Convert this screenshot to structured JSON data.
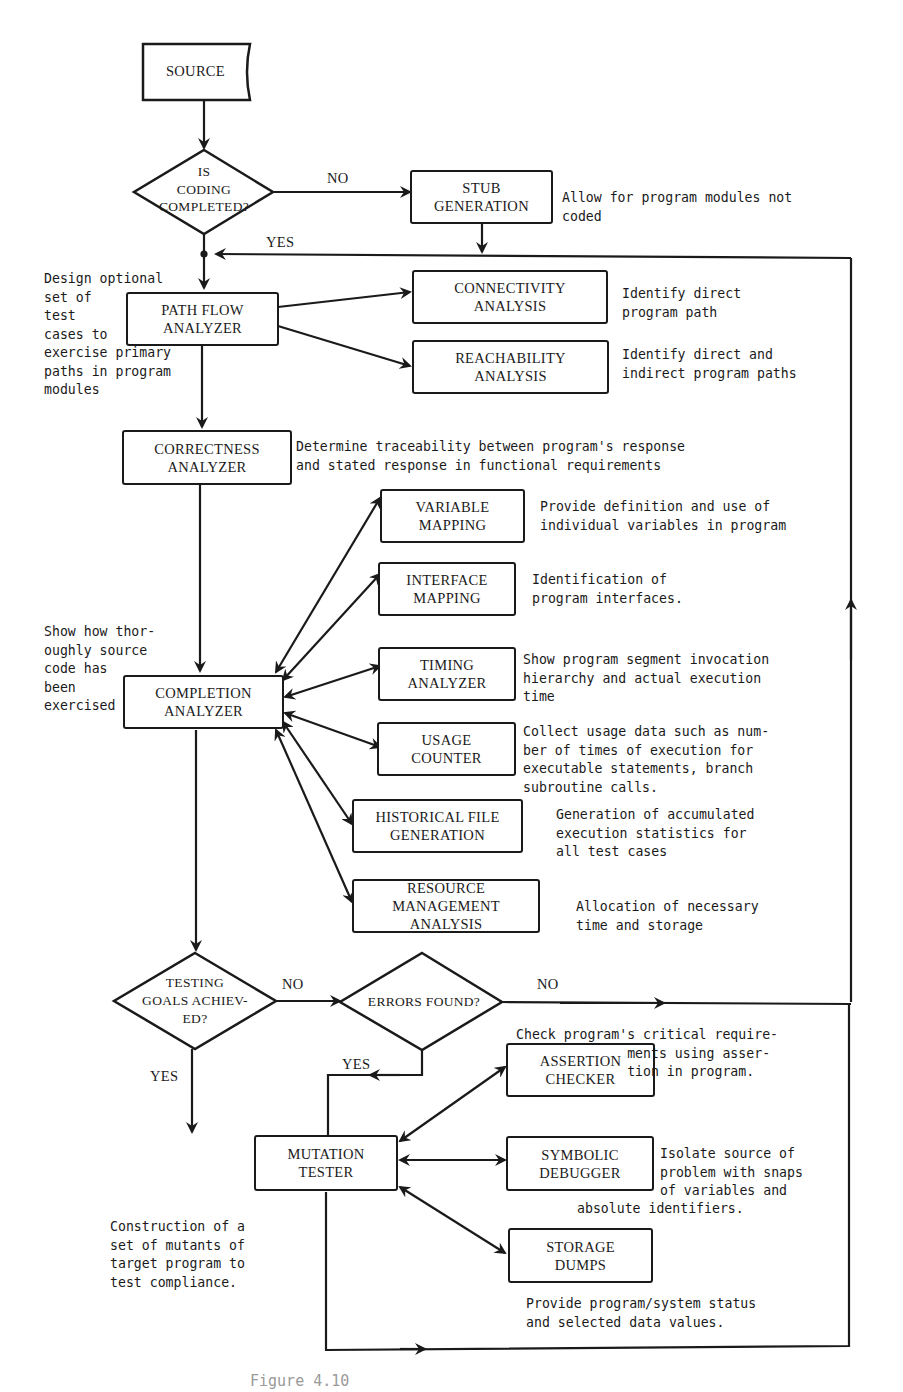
{
  "nodes": {
    "source": "SOURCE",
    "coding_decision": "IS\nCODING\nCOMPLETED?",
    "stub_generation": "STUB\nGENERATION",
    "path_flow": "PATH FLOW\nANALYZER",
    "connectivity": "CONNECTIVITY\nANALYSIS",
    "reachability": "REACHABILITY\nANALYSIS",
    "correctness": "CORRECTNESS\nANALYZER",
    "variable_mapping": "VARIABLE\nMAPPING",
    "interface_mapping": "INTERFACE\nMAPPING",
    "completion": "COMPLETION\nANALYZER",
    "timing": "TIMING\nANALYZER",
    "usage_counter": "USAGE\nCOUNTER",
    "historical_file": "HISTORICAL FILE\nGENERATION",
    "resource_mgmt": "RESOURCE MANAGEMENT\nANALYSIS",
    "testing_goals_decision": "TESTING\nGOALS ACHIEV-\nED?",
    "errors_decision": "ERRORS FOUND?",
    "assertion_checker": "ASSERTION\nCHECKER",
    "mutation_tester": "MUTATION\nTESTER",
    "symbolic_debugger": "SYMBOLIC\nDEBUGGER",
    "storage_dumps": "STORAGE\nDUMPS"
  },
  "edge_labels": {
    "coding_no": "NO",
    "coding_yes": "YES",
    "goals_no": "NO",
    "goals_yes": "YES",
    "errors_no": "NO",
    "errors_yes": "YES"
  },
  "notes": {
    "stub_generation": "Allow for program modules not\ncoded",
    "path_flow": "Design optional\nset of\ntest\ncases to\nexercise primary\npaths in program\nmodules",
    "connectivity": "Identify direct\nprogram path",
    "reachability": "Identify direct and\nindirect program paths",
    "correctness": "Determine traceability between program's response\nand stated response in functional requirements",
    "variable_mapping": "Provide definition and use of\nindividual variables in program",
    "interface_mapping": "Identification of\nprogram interfaces.",
    "completion": "Show how thor-\noughly source\ncode has\nbeen\nexercised",
    "timing": "Show program segment invocation\nhierarchy and actual execution\ntime",
    "usage_counter": "Collect usage data such as num-\nber of times of execution for\nexecutable statements, branch\nsubroutine calls.",
    "historical_file": "Generation of accumulated\nexecution statistics for\nall test cases",
    "resource_mgmt": "Allocation of necessary\ntime and storage",
    "assertion_checker": "Check program's critical require-\n              ments using asser-\n              tion in program.",
    "symbolic_debugger": "Isolate source of\nproblem with snaps\nof variables and",
    "symbolic_debugger_tail": "absolute identifiers.",
    "mutation_tester": "Construction of a\nset of mutants of\ntarget program to\ntest compliance.",
    "storage_dumps": "Provide program/system status\nand selected data values."
  },
  "caption": "Figure 4.10"
}
